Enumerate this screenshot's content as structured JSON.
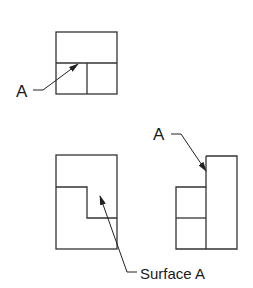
{
  "diagram": {
    "type": "orthographic-projection",
    "line_color": "#333333",
    "background": "#ffffff",
    "views": {
      "top": {
        "name": "top-view",
        "outline": {
          "x": 56,
          "y": 32,
          "w": 61,
          "h": 62
        },
        "lines": [
          [
            56,
            63,
            117,
            63
          ],
          [
            87,
            63,
            87,
            94
          ]
        ]
      },
      "front": {
        "name": "front-view",
        "outline": {
          "x": 56,
          "y": 155,
          "w": 61,
          "h": 94
        },
        "step": "56,187 87,187 87,218 117,218"
      },
      "side": {
        "name": "side-view",
        "outline_path": "206,156 237,156 237,249 176,249 176,187 206,187 206,156",
        "lines": [
          [
            206,
            187,
            206,
            249
          ],
          [
            176,
            218,
            206,
            218
          ]
        ]
      }
    },
    "labels": [
      {
        "id": "label-a-top",
        "text": "A",
        "x": 16,
        "y": 97,
        "size": 17,
        "leader": "33,90 43,90 78,64"
      },
      {
        "id": "label-a-side",
        "text": "A",
        "x": 153,
        "y": 140,
        "size": 17,
        "leader": "171,134 181,134 206,171"
      },
      {
        "id": "label-surface-a",
        "text": "Surface A",
        "x": 140,
        "y": 279,
        "size": 15,
        "leader": "137,272 127,272 100,196"
      }
    ]
  }
}
